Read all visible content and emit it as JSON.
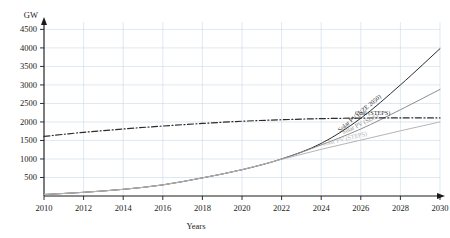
{
  "chart_data": {
    "type": "line",
    "title": "",
    "xlabel": "Years",
    "ylabel": "GW",
    "xlim": [
      2010,
      2030
    ],
    "ylim": [
      0,
      4700
    ],
    "grid": true,
    "legend_position": "inline-right",
    "x": [
      2010,
      2012,
      2014,
      2016,
      2018,
      2020,
      2022,
      2024,
      2026,
      2028,
      2030
    ],
    "xticks": [
      "2010",
      "2012",
      "2014",
      "2016",
      "2018",
      "2020",
      "2022",
      "2024",
      "2026",
      "2028",
      "2030"
    ],
    "yticks": [
      "500",
      "1000",
      "1500",
      "2000",
      "2500",
      "3000",
      "3500",
      "4000",
      "4500"
    ],
    "series": [
      {
        "name": "Solar PV (NZE 2050)",
        "color": "#2b2b2b",
        "style": "solid",
        "values": [
          40,
          100,
          180,
          300,
          490,
          710,
          1000,
          1420,
          2100,
          3000,
          3980
        ]
      },
      {
        "name": "Solar PV (SDS)",
        "color": "#8c8c8c",
        "style": "solid",
        "values": [
          40,
          100,
          180,
          300,
          490,
          710,
          1000,
          1380,
          1810,
          2330,
          2880
        ]
      },
      {
        "name": "Coal (STEPS)",
        "color": "#2b2b2b",
        "style": "dash-dot",
        "values": [
          1610,
          1720,
          1810,
          1890,
          1960,
          2020,
          2060,
          2090,
          2105,
          2110,
          2110
        ]
      },
      {
        "name": "Solar PV (STEPS)",
        "color": "#b5b5b5",
        "style": "solid",
        "values": [
          40,
          100,
          180,
          300,
          490,
          710,
          990,
          1260,
          1510,
          1760,
          2000
        ]
      }
    ]
  },
  "axes": {
    "y_axis_title": "GW",
    "x_axis_title": "Years"
  },
  "colors": {
    "grid": "#c9d9e8",
    "axis": "#1a1a1a",
    "background": "#ffffff"
  }
}
